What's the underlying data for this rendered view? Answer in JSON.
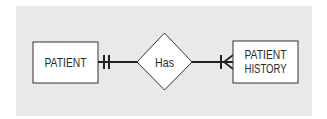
{
  "diagram": {
    "type": "entity-relationship",
    "notation": "crow's foot",
    "colors": {
      "background": "#e9e9e9",
      "shape_fill": "#ffffff",
      "stroke": "#222222",
      "text": "#2a2a2a"
    },
    "entities": [
      {
        "id": "patient",
        "lines": [
          "PATIENT"
        ]
      },
      {
        "id": "patient_history",
        "lines": [
          "PATIENT",
          "HISTORY"
        ]
      }
    ],
    "relationship": {
      "label": "Has",
      "from": "patient",
      "to": "patient_history",
      "from_cardinality": "one-and-only-one",
      "to_cardinality": "one-or-many"
    }
  }
}
